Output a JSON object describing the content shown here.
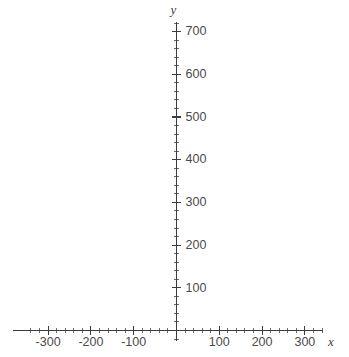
{
  "chart_data": {
    "type": "line",
    "title": "",
    "subtitle": "",
    "xlabel": "x",
    "ylabel": "y",
    "series": [],
    "annotations": [],
    "grid": false,
    "legend": null,
    "xlim": [
      -350,
      345
    ],
    "ylim": [
      -20,
      730
    ],
    "x_major_ticks": [
      -300,
      -200,
      -100,
      100,
      200,
      300
    ],
    "x_major_tick_labels": [
      "-300",
      "-200",
      "-100",
      "100",
      "200",
      "300"
    ],
    "y_major_ticks": [
      100,
      200,
      300,
      400,
      500,
      600,
      700
    ],
    "y_major_tick_labels": [
      "100",
      "200",
      "300",
      "400",
      "500",
      "600",
      "700"
    ],
    "x_minor_tick_step": 20,
    "y_minor_tick_step": 20,
    "x_minor_tick_range": [
      -340,
      340
    ],
    "y_minor_tick_range": [
      -20,
      720
    ],
    "origin_label": "",
    "axis_color": "#3c3c3c",
    "tick_label_color": "#4a4a4a",
    "background_color": "#ffffff"
  },
  "figure": {
    "width": 349,
    "height": 357,
    "axis_x_pixel": 176.5,
    "axis_y_pixel": 330.5,
    "units_per_pixel_x": 42.8,
    "units_per_pixel_y": 42.7,
    "x_axis_left_px": 13,
    "x_axis_right_px": 323,
    "y_axis_top_px": 22,
    "y_axis_bottom_px": 341
  }
}
